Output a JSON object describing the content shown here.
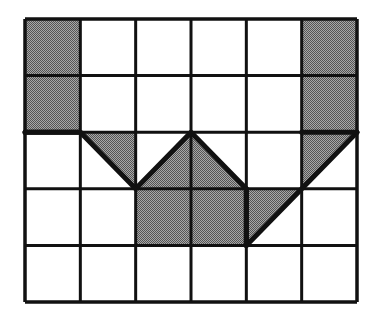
{
  "diagram": {
    "grid": {
      "columns": 6,
      "rows": 5
    },
    "colors": {
      "background": "#ffffff",
      "grid_line": "#111111",
      "shade_dark": "#555555",
      "shade_light": "#a8a8a8"
    },
    "shaded_cells": [
      {
        "row": 0,
        "col": 0
      },
      {
        "row": 1,
        "col": 0
      },
      {
        "row": 0,
        "col": 5
      },
      {
        "row": 1,
        "col": 5
      },
      {
        "row": 3,
        "col": 2
      },
      {
        "row": 3,
        "col": 3
      }
    ],
    "shaded_triangles": [
      {
        "row": 2,
        "col": 1,
        "corners": [
          "tl",
          "tr",
          "br"
        ]
      },
      {
        "row": 2,
        "col": 2,
        "corners": [
          "bl",
          "tr",
          "br"
        ]
      },
      {
        "row": 2,
        "col": 3,
        "corners": [
          "tl",
          "bl",
          "br"
        ]
      },
      {
        "row": 2,
        "col": 5,
        "corners": [
          "tl",
          "tr",
          "bl"
        ]
      },
      {
        "row": 3,
        "col": 4,
        "corners": [
          "tl",
          "tr",
          "bl"
        ]
      }
    ],
    "outline_path": [
      [
        0,
        2
      ],
      [
        1,
        2
      ],
      [
        2,
        3
      ],
      [
        3,
        2
      ],
      [
        4,
        3
      ],
      [
        4,
        4
      ],
      [
        6,
        2
      ]
    ],
    "extra_outline_segments": [
      [
        [
          0,
          2
        ],
        [
          1,
          2
        ]
      ],
      [
        [
          4,
          3
        ],
        [
          4,
          4
        ]
      ],
      [
        [
          5,
          2
        ],
        [
          6,
          2
        ]
      ]
    ]
  }
}
